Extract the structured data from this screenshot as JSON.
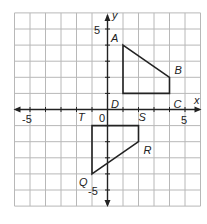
{
  "diagram": {
    "type": "coordinate-plane",
    "x_range": [
      -6,
      6
    ],
    "y_range": [
      -6,
      6
    ],
    "origin_px": [
      107.5,
      109.5
    ],
    "unit_px": [
      15.5,
      16.1
    ],
    "colors": {
      "grid": "#b8b8b8",
      "axis": "#222222",
      "shape": "#222222",
      "background": "#ffffff"
    },
    "axis_labels": {
      "x": "x",
      "y": "y"
    },
    "tick_labels": [
      {
        "text": "-5",
        "axis": "x",
        "value": -5
      },
      {
        "text": "5",
        "axis": "x",
        "value": 5
      },
      {
        "text": "5",
        "axis": "y",
        "value": 5
      },
      {
        "text": "-5",
        "axis": "y",
        "value": -5
      },
      {
        "text": "0",
        "axis": "origin",
        "value": 0
      }
    ],
    "shapes": [
      {
        "name": "ABCD",
        "vertices": [
          {
            "label": "A",
            "x": 1,
            "y": 4
          },
          {
            "label": "B",
            "x": 4,
            "y": 2
          },
          {
            "label": "C",
            "x": 4,
            "y": 1
          },
          {
            "label": "D",
            "x": 1,
            "y": 1
          }
        ]
      },
      {
        "name": "QRST",
        "vertices": [
          {
            "label": "Q",
            "x": -1,
            "y": -4
          },
          {
            "label": "R",
            "x": 2,
            "y": -2
          },
          {
            "label": "S",
            "x": 2,
            "y": -1
          },
          {
            "label": "T",
            "x": -1,
            "y": -1
          }
        ]
      }
    ]
  }
}
